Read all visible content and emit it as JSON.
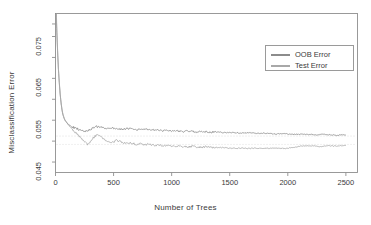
{
  "chart_data": {
    "type": "line",
    "title": "",
    "xlabel": "Number of Trees",
    "ylabel": "Misclassification Error",
    "xlim": [
      0,
      2600
    ],
    "ylim": [
      0.0425,
      0.0805
    ],
    "xticks": [
      0,
      500,
      1000,
      1500,
      2000,
      2500
    ],
    "xtick_labels": [
      "0",
      "500",
      "1000",
      "1500",
      "2000",
      "2500"
    ],
    "yticks": [
      0.045,
      0.055,
      0.065,
      0.075
    ],
    "ytick_labels": [
      "0.045",
      "0.055",
      "0.065",
      "0.075"
    ],
    "grid": false,
    "legend_position": "top-right",
    "legend": [
      "OOB Error",
      "Test Error"
    ],
    "series": [
      {
        "name": "OOB Error",
        "color": "#8c8c8c",
        "x": [
          1,
          5,
          10,
          15,
          20,
          25,
          30,
          35,
          40,
          45,
          50,
          55,
          60,
          65,
          70,
          75,
          80,
          85,
          90,
          95,
          100,
          110,
          120,
          130,
          140,
          150,
          160,
          170,
          180,
          190,
          200,
          215,
          230,
          245,
          260,
          275,
          290,
          305,
          320,
          335,
          350,
          365,
          380,
          400,
          420,
          440,
          460,
          480,
          500,
          525,
          550,
          575,
          600,
          625,
          650,
          675,
          700,
          725,
          750,
          775,
          800,
          830,
          860,
          890,
          920,
          950,
          980,
          1010,
          1040,
          1070,
          1100,
          1140,
          1180,
          1220,
          1260,
          1300,
          1340,
          1380,
          1420,
          1460,
          1500,
          1550,
          1600,
          1650,
          1700,
          1750,
          1800,
          1850,
          1900,
          1950,
          2000,
          2060,
          2120,
          2180,
          2240,
          2300,
          2360,
          2420,
          2480,
          2500
        ],
        "y": [
          0.086,
          0.082,
          0.077,
          0.0735,
          0.07,
          0.0672,
          0.065,
          0.063,
          0.0612,
          0.0598,
          0.0586,
          0.0576,
          0.0568,
          0.0562,
          0.0558,
          0.0554,
          0.0551,
          0.0549,
          0.0547,
          0.0545,
          0.0543,
          0.054,
          0.0538,
          0.0536,
          0.0534,
          0.0533,
          0.0532,
          0.0531,
          0.053,
          0.0529,
          0.0528,
          0.0527,
          0.0526,
          0.0525,
          0.0524,
          0.0524,
          0.0526,
          0.0529,
          0.0531,
          0.0533,
          0.0534,
          0.0534,
          0.0533,
          0.0532,
          0.0531,
          0.053,
          0.0531,
          0.0532,
          0.0531,
          0.053,
          0.0529,
          0.0528,
          0.0529,
          0.053,
          0.0529,
          0.0528,
          0.0527,
          0.0528,
          0.0529,
          0.0528,
          0.0527,
          0.0526,
          0.0527,
          0.0526,
          0.0525,
          0.0526,
          0.0525,
          0.0524,
          0.0525,
          0.0524,
          0.0523,
          0.0524,
          0.0523,
          0.0522,
          0.0523,
          0.0522,
          0.0521,
          0.0522,
          0.0521,
          0.052,
          0.0521,
          0.052,
          0.0519,
          0.052,
          0.0519,
          0.0518,
          0.0519,
          0.0518,
          0.0517,
          0.0518,
          0.0517,
          0.0516,
          0.0517,
          0.0516,
          0.0515,
          0.0516,
          0.0515,
          0.0514,
          0.0515,
          0.0514
        ]
      },
      {
        "name": "Test Error",
        "color": "#a8a8a8",
        "x": [
          1,
          5,
          10,
          15,
          20,
          25,
          30,
          35,
          40,
          45,
          50,
          55,
          60,
          65,
          70,
          75,
          80,
          85,
          90,
          95,
          100,
          110,
          120,
          130,
          140,
          150,
          160,
          170,
          180,
          190,
          200,
          215,
          230,
          245,
          260,
          275,
          290,
          305,
          320,
          335,
          350,
          365,
          380,
          400,
          420,
          440,
          460,
          480,
          500,
          525,
          550,
          575,
          600,
          625,
          650,
          675,
          700,
          725,
          750,
          775,
          800,
          830,
          860,
          890,
          920,
          950,
          980,
          1010,
          1040,
          1070,
          1100,
          1140,
          1180,
          1220,
          1260,
          1300,
          1340,
          1380,
          1420,
          1460,
          1500,
          1550,
          1600,
          1650,
          1700,
          1750,
          1800,
          1850,
          1900,
          1950,
          2000,
          2060,
          2120,
          2180,
          2240,
          2300,
          2360,
          2420,
          2480,
          2500
        ],
        "y": [
          0.088,
          0.083,
          0.078,
          0.074,
          0.0705,
          0.0676,
          0.0652,
          0.0632,
          0.0614,
          0.06,
          0.0588,
          0.0578,
          0.057,
          0.0564,
          0.0559,
          0.0555,
          0.0552,
          0.0549,
          0.0547,
          0.0545,
          0.0543,
          0.0539,
          0.0536,
          0.0533,
          0.053,
          0.0527,
          0.0524,
          0.0521,
          0.0518,
          0.0515,
          0.0512,
          0.0508,
          0.0504,
          0.05,
          0.0496,
          0.0493,
          0.0496,
          0.0501,
          0.0506,
          0.051,
          0.0513,
          0.0515,
          0.0512,
          0.0508,
          0.0504,
          0.05,
          0.0497,
          0.0495,
          0.0498,
          0.0502,
          0.05,
          0.0497,
          0.0495,
          0.0494,
          0.0496,
          0.0494,
          0.0492,
          0.0494,
          0.0492,
          0.0491,
          0.0493,
          0.0491,
          0.0489,
          0.0491,
          0.0489,
          0.0488,
          0.049,
          0.0488,
          0.0487,
          0.0489,
          0.0487,
          0.0486,
          0.0488,
          0.0486,
          0.0485,
          0.0487,
          0.0485,
          0.0484,
          0.0485,
          0.0484,
          0.0483,
          0.0483,
          0.0483,
          0.0483,
          0.0483,
          0.0483,
          0.0483,
          0.0483,
          0.0483,
          0.0483,
          0.0483,
          0.0486,
          0.0488,
          0.0489,
          0.0488,
          0.0487,
          0.0489,
          0.0488,
          0.049,
          0.0489
        ]
      }
    ],
    "reference_lines": [
      {
        "y": 0.0512,
        "color": "#d2d2d2"
      },
      {
        "y": 0.0492,
        "color": "#d6d6d6"
      }
    ]
  },
  "axes": {
    "box_color": "#8f8f8f",
    "tick_color": "#8f8f8f",
    "text_color": "#3a3a3a"
  },
  "legend": {
    "items": [
      {
        "label": "OOB Error",
        "color": "#8c8c8c"
      },
      {
        "label": "Test Error",
        "color": "#a8a8a8"
      }
    ]
  }
}
